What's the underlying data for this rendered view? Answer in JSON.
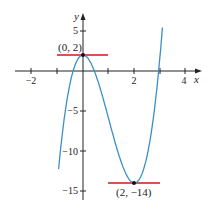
{
  "chart_data": {
    "type": "line",
    "title": "",
    "xlabel": "x",
    "ylabel": "y",
    "xlim": [
      -2.5,
      4.5
    ],
    "ylim": [
      -16,
      7
    ],
    "x_ticks": [
      -2,
      -1,
      0,
      1,
      2,
      3,
      4
    ],
    "x_tick_labels": [
      "−2",
      "",
      "",
      "",
      "2",
      "",
      "4"
    ],
    "y_ticks": [
      5,
      -5,
      -10,
      -15
    ],
    "y_tick_labels": [
      "5",
      "−5",
      "−10",
      "−15"
    ],
    "grid": false,
    "legend": null,
    "series": [
      {
        "name": "f(x) = 4x³ − 12x² + 2",
        "color": "#3a8fc8",
        "x": [
          -0.92,
          -0.75,
          -0.5,
          -0.25,
          0,
          0.25,
          0.5,
          0.75,
          1,
          1.25,
          1.5,
          1.75,
          2,
          2.25,
          2.5,
          2.75,
          3,
          3.2
        ],
        "y": [
          -11.3,
          -6.4,
          -1.5,
          1.19,
          2,
          1.31,
          -0.5,
          -3.06,
          -6,
          -8.94,
          -11.5,
          -13.31,
          -14,
          -13.19,
          -10.5,
          -5.56,
          2,
          7.8
        ]
      }
    ],
    "tangent_lines": [
      {
        "name": "horizontal tangent at (0, 2)",
        "color": "#e05050",
        "x": [
          -1,
          1
        ],
        "y": 2
      },
      {
        "name": "horizontal tangent at (2, -14)",
        "color": "#e05050",
        "x": [
          1,
          3
        ],
        "y": -14
      }
    ],
    "annotations": [
      {
        "text": "(0, 2)",
        "x": 0,
        "y": 2
      },
      {
        "text": "(2, −14)",
        "x": 2,
        "y": -14
      }
    ]
  },
  "labels": {
    "x_axis": "x",
    "y_axis": "y",
    "xt_m2": "−2",
    "xt_2": "2",
    "xt_4": "4",
    "yt_5": "5",
    "yt_m5": "−5",
    "yt_m10": "−10",
    "yt_m15": "−15",
    "pt_max": "(0, 2)",
    "pt_min": "(2, −14)"
  }
}
